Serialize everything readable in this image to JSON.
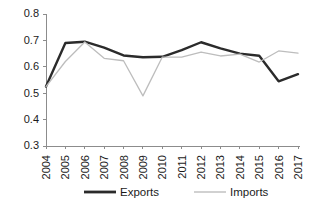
{
  "chart_data": {
    "type": "line",
    "title": "",
    "subtitle": "",
    "xlabel": "",
    "ylabel": "",
    "categories": [
      "2004",
      "2005",
      "2006",
      "2007",
      "2008",
      "2009",
      "2010",
      "2011",
      "2012",
      "2013",
      "2014",
      "2015",
      "2016",
      "2017"
    ],
    "series": [
      {
        "name": "Exports",
        "color": "#2b2b2b",
        "line_width": 2.4,
        "values": [
          0.525,
          0.69,
          0.695,
          0.673,
          0.643,
          0.636,
          0.638,
          0.663,
          0.693,
          0.67,
          0.65,
          0.642,
          0.545,
          0.572
        ]
      },
      {
        "name": "Imports",
        "color": "#bdbdbd",
        "line_width": 1.3,
        "values": [
          0.525,
          0.62,
          0.694,
          0.632,
          0.623,
          0.49,
          0.637,
          0.637,
          0.656,
          0.641,
          0.648,
          0.618,
          0.66,
          0.652
        ]
      }
    ],
    "ylim": [
      0.3,
      0.8
    ],
    "ytick_values": [
      "0.8",
      "0.7",
      "0.6",
      "0.5",
      "0.4",
      "0.3"
    ],
    "ytick_numbers": [
      0.8,
      0.7,
      0.6,
      0.5,
      0.4,
      0.3
    ],
    "grid": false,
    "legend_position": "bottom",
    "legend": [
      {
        "label": "Exports",
        "color": "#2b2b2b",
        "line_width": 2.8
      },
      {
        "label": "Imports",
        "color": "#bdbdbd",
        "line_width": 1.4
      }
    ],
    "axis_color": "#8c8c8c",
    "background": "#ffffff"
  }
}
